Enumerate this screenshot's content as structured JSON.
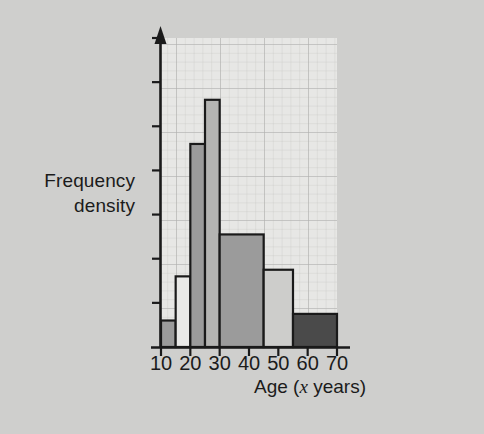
{
  "chart_data": {
    "type": "bar",
    "title": "",
    "subtitle": "",
    "xlabel": "Age (x years)",
    "xlabel_parts": {
      "before": "Age (",
      "italic": "x",
      "after": " years)"
    },
    "ylabel": "Frequency density",
    "ylabel_line1": "Frequency",
    "ylabel_line2": "density",
    "xlim": [
      10,
      70
    ],
    "ylim": [
      0,
      7
    ],
    "xticks": [
      10,
      20,
      30,
      40,
      50,
      60,
      70
    ],
    "xtick_labels": [
      "10",
      "20",
      "30",
      "40",
      "50",
      "60",
      "70"
    ],
    "ytick_values": [
      1,
      2,
      3,
      4,
      5,
      6,
      7
    ],
    "ytick_labels": [
      "",
      "",
      "",
      "",
      "",
      "",
      ""
    ],
    "grid": true,
    "grid_minor": true,
    "legend": "none",
    "bar_edges": [
      10,
      15,
      20,
      25,
      30,
      45,
      55,
      70
    ],
    "categories": [
      "10-15",
      "15-20",
      "20-25",
      "25-30",
      "30-45",
      "45-55",
      "55-70"
    ],
    "values": [
      0.6,
      1.6,
      4.6,
      5.6,
      2.55,
      1.75,
      0.75
    ],
    "bars": [
      {
        "label": "10-15",
        "x0": 10,
        "x1": 15,
        "height": 0.6,
        "fill": "#9b9b9b"
      },
      {
        "label": "15-20",
        "x0": 15,
        "x1": 20,
        "height": 1.6,
        "fill": "#e9e9e7"
      },
      {
        "label": "20-25",
        "x0": 20,
        "x1": 25,
        "height": 4.6,
        "fill": "#9b9b9b"
      },
      {
        "label": "25-30",
        "x0": 25,
        "x1": 30,
        "height": 5.6,
        "fill": "#b4b4b2"
      },
      {
        "label": "30-45",
        "x0": 30,
        "x1": 45,
        "height": 2.55,
        "fill": "#9b9b9b"
      },
      {
        "label": "45-55",
        "x0": 45,
        "x1": 55,
        "height": 1.75,
        "fill": "#cdcdcb"
      },
      {
        "label": "55-70",
        "x0": 55,
        "x1": 70,
        "height": 0.75,
        "fill": "#4a4a4a"
      }
    ],
    "colors": {
      "axis": "#1a1a1a",
      "bar_edge": "#1a1a1a",
      "grid_minor": "#c3c3c1",
      "grid_major": "#b0b0ae",
      "plot_background": "#e6e6e4",
      "page_background": "#cfcfcd",
      "text": "#1b1b1b"
    }
  }
}
